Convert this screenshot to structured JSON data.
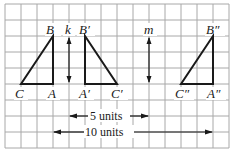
{
  "diagram": {
    "grid": {
      "x0": 5,
      "y0": 4,
      "cell": 16,
      "cols": 14,
      "rows": 9,
      "color": "#9a9a9a"
    },
    "triangles": [
      {
        "name": "ABC",
        "labels": {
          "B": "B",
          "A": "A",
          "C": "C"
        }
      },
      {
        "name": "A'B'C'",
        "labels": {
          "B": "B′",
          "A": "A′",
          "C": "C′"
        }
      },
      {
        "name": "A''B''C''",
        "labels": {
          "B": "B″",
          "A": "A″",
          "C": "C″"
        }
      }
    ],
    "lines": {
      "k": "k",
      "m": "m"
    },
    "dimensions": {
      "five": "5 units",
      "ten": "10 units"
    },
    "stroke_color": "#1a1a1a"
  }
}
